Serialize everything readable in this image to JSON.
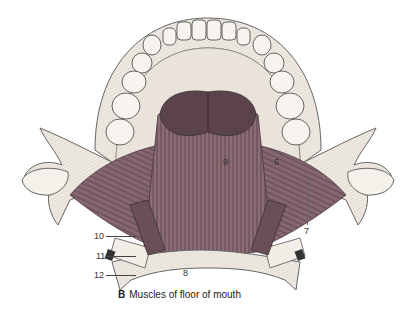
{
  "figure": {
    "caption_letter": "B",
    "caption_text": "Muscles of floor of mouth",
    "colors": {
      "muscle": "#8a6a73",
      "muscle_dark": "#5e4550",
      "bone": "#efe9e2",
      "bone_line": "#777",
      "gland": "#5a3f48",
      "teeth": "#f6f3ee"
    },
    "labels": [
      {
        "id": "6",
        "text": "6"
      },
      {
        "id": "7",
        "text": "7"
      },
      {
        "id": "8",
        "text": "8"
      },
      {
        "id": "9",
        "text": "9"
      },
      {
        "id": "10",
        "text": "10"
      },
      {
        "id": "11",
        "text": "11"
      },
      {
        "id": "12",
        "text": "12"
      }
    ]
  }
}
